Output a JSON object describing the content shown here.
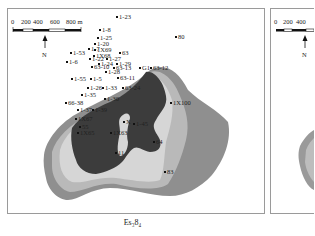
{
  "figure": {
    "caption": "Es₃8₄",
    "panels": [
      {
        "id": "left-map",
        "scale_bar": {
          "labels": [
            "0",
            "200",
            "400",
            "600",
            "800 m"
          ]
        },
        "north_arrow": {
          "label": "N"
        }
      },
      {
        "id": "right-map",
        "scale_bar": {
          "labels": [
            "0",
            "200",
            "400"
          ]
        },
        "north_arrow": {
          "label": "N"
        }
      }
    ]
  },
  "wells": [
    {
      "name": "1-23",
      "x": 117,
      "y": 17
    },
    {
      "name": "1-8",
      "x": 100,
      "y": 30
    },
    {
      "name": "1-25",
      "x": 98,
      "y": 38
    },
    {
      "name": "80",
      "x": 176,
      "y": 37
    },
    {
      "name": "1-20",
      "x": 95,
      "y": 44
    },
    {
      "name": "1-7",
      "x": 89,
      "y": 49
    },
    {
      "name": "1X69",
      "x": 95,
      "y": 50
    },
    {
      "name": "1-53",
      "x": 71,
      "y": 53
    },
    {
      "name": "1X68",
      "x": 94,
      "y": 56
    },
    {
      "name": "63",
      "x": 120,
      "y": 53
    },
    {
      "name": "1-22",
      "x": 90,
      "y": 59
    },
    {
      "name": "1-27",
      "x": 107,
      "y": 59
    },
    {
      "name": "1-6",
      "x": 67,
      "y": 62
    },
    {
      "name": "1-24",
      "x": 99,
      "y": 64
    },
    {
      "name": "1-29",
      "x": 117,
      "y": 64
    },
    {
      "name": "G1",
      "x": 140,
      "y": 68
    },
    {
      "name": "63-12",
      "x": 151,
      "y": 68
    },
    {
      "name": "63-10",
      "x": 92,
      "y": 67
    },
    {
      "name": "63-13",
      "x": 114,
      "y": 68
    },
    {
      "name": "1-28",
      "x": 106,
      "y": 72
    },
    {
      "name": "1-55",
      "x": 72,
      "y": 79
    },
    {
      "name": "1-5",
      "x": 91,
      "y": 79
    },
    {
      "name": "63-11",
      "x": 118,
      "y": 78
    },
    {
      "name": "1-26",
      "x": 88,
      "y": 88
    },
    {
      "name": "1-33",
      "x": 103,
      "y": 88
    },
    {
      "name": "63-24",
      "x": 123,
      "y": 88
    },
    {
      "name": "1-35",
      "x": 82,
      "y": 95
    },
    {
      "name": "1-30",
      "x": 105,
      "y": 99
    },
    {
      "name": "1X100",
      "x": 171,
      "y": 103
    },
    {
      "name": "66-38",
      "x": 66,
      "y": 103
    },
    {
      "name": "1-37",
      "x": 78,
      "y": 110
    },
    {
      "name": "1-39",
      "x": 93,
      "y": 110
    },
    {
      "name": "1X67",
      "x": 76,
      "y": 119
    },
    {
      "name": "X",
      "x": 124,
      "y": 122
    },
    {
      "name": "1-45",
      "x": 134,
      "y": 124
    },
    {
      "name": "55",
      "x": 80,
      "y": 127
    },
    {
      "name": "1X65",
      "x": 78,
      "y": 133
    },
    {
      "name": "1X63",
      "x": 111,
      "y": 133
    },
    {
      "name": "64",
      "x": 154,
      "y": 142
    },
    {
      "name": "11",
      "x": 116,
      "y": 153
    },
    {
      "name": "83",
      "x": 165,
      "y": 172
    }
  ],
  "legend_colors": {
    "outer_zone": "#8f8f8f",
    "middle_zone": "#b9b9b9",
    "inner_zone": "#d6d6d6",
    "core_zone": "#3c3c3c"
  }
}
